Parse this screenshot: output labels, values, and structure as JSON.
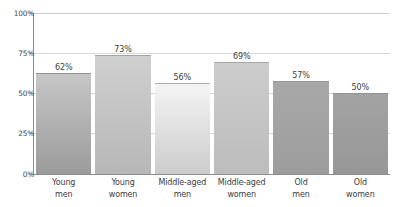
{
  "chart_data": {
    "type": "bar",
    "title": "",
    "subtitle": "",
    "xlabel": "",
    "ylabel": "",
    "categories": [
      "Young men",
      "Young women",
      "Middle-aged men",
      "Middle-aged women",
      "Old men",
      "Old women"
    ],
    "category_lines": [
      [
        "Young",
        "men"
      ],
      [
        "Young",
        "women"
      ],
      [
        "Middle-aged",
        "men"
      ],
      [
        "Middle-aged",
        "women"
      ],
      [
        "Old",
        "men"
      ],
      [
        "Old",
        "women"
      ]
    ],
    "values": [
      62,
      73,
      56,
      69,
      57,
      50
    ],
    "value_labels": [
      "62%",
      "73%",
      "56%",
      "69%",
      "57%",
      "50%"
    ],
    "ylim": [
      0,
      100
    ],
    "yticks": [
      0,
      25,
      50,
      75,
      100
    ],
    "ytick_labels": [
      "0%",
      "25%",
      "50%",
      "75%",
      "100%"
    ],
    "grid": true,
    "gridlines_at": [
      25,
      50,
      75,
      100
    ],
    "legend": "none",
    "bar_colors_top": [
      "#c6c6c6",
      "#cfcfcf",
      "#f4f4f4",
      "#cdcdcd",
      "#a8a8a8",
      "#a3a3a3"
    ],
    "bar_colors_bottom": [
      "#9b9b9b",
      "#b7b7b7",
      "#cccccc",
      "#bcbcbc",
      "#9d9d9d",
      "#979797"
    ],
    "axis_color": "#8c8c8c",
    "grid_color": "#d8d8d8",
    "text_color": "#3d3d3d",
    "background_color": "#ffffff"
  }
}
